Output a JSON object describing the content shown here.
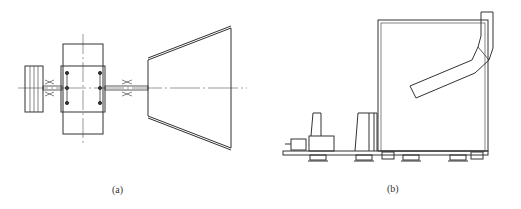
{
  "figure": {
    "panels": [
      {
        "id": "a",
        "caption": "(a)",
        "description": "Top view: motor drum, bearing block with bolts, couplings and conical fan housing on shaft"
      },
      {
        "id": "b",
        "caption": "(b)",
        "description": "Side view: motor and fan on base frame with vibration isolators, housing with angled outlet duct"
      }
    ],
    "colors": {
      "line": "#333333",
      "background": "#ffffff"
    }
  }
}
